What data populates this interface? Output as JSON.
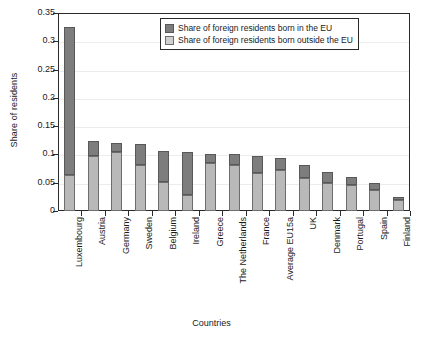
{
  "chart_data": {
    "type": "bar",
    "stacked": true,
    "title": "",
    "xlabel": "Countries",
    "ylabel": "Share of residents",
    "ylim": [
      0,
      0.35
    ],
    "yticks": [
      "0",
      "0.05",
      "0.1",
      "0.15",
      "0.2",
      "0.25",
      "0.3",
      "0.35"
    ],
    "ytick_values": [
      0,
      0.05,
      0.1,
      0.15,
      0.2,
      0.25,
      0.3,
      0.35
    ],
    "grid": true,
    "legend_position": "top-right-inside",
    "categories": [
      "Luxembourg",
      "Austria",
      "Germany",
      "Sweden",
      "Belgium",
      "Ireland",
      "Greece",
      "The Netherlands",
      "France",
      "Average EU15a",
      "UK",
      "Denmark",
      "Portugal",
      "Spain",
      "Finland"
    ],
    "series": [
      {
        "name": "Share of foreign residents born outside the EU",
        "color": "#b9b9b9",
        "values": [
          0.064,
          0.097,
          0.105,
          0.081,
          0.051,
          0.028,
          0.085,
          0.082,
          0.068,
          0.072,
          0.058,
          0.049,
          0.046,
          0.038,
          0.019
        ]
      },
      {
        "name": "Share of foreign residents born in the EU",
        "color": "#7d7d7d",
        "values": [
          0.262,
          0.026,
          0.015,
          0.038,
          0.055,
          0.076,
          0.016,
          0.018,
          0.03,
          0.021,
          0.024,
          0.02,
          0.014,
          0.012,
          0.005
        ]
      }
    ],
    "totals": [
      0.326,
      0.123,
      0.12,
      0.119,
      0.106,
      0.104,
      0.101,
      0.1,
      0.098,
      0.093,
      0.082,
      0.069,
      0.06,
      0.05,
      0.024
    ]
  },
  "axes": {
    "y_title": "Share of residents",
    "x_title": "Countries"
  },
  "legend": {
    "items": [
      {
        "label": "Share of foreign residents born in the EU",
        "swatch": "in"
      },
      {
        "label": "Share of foreign residents born outside the EU",
        "swatch": "outside"
      }
    ]
  },
  "colors": {
    "series_in_eu": "#7d7d7d",
    "series_outside_eu": "#b9b9b9",
    "axis": "#2a2a2a",
    "grid": "#ececec",
    "background": "#ffffff"
  }
}
